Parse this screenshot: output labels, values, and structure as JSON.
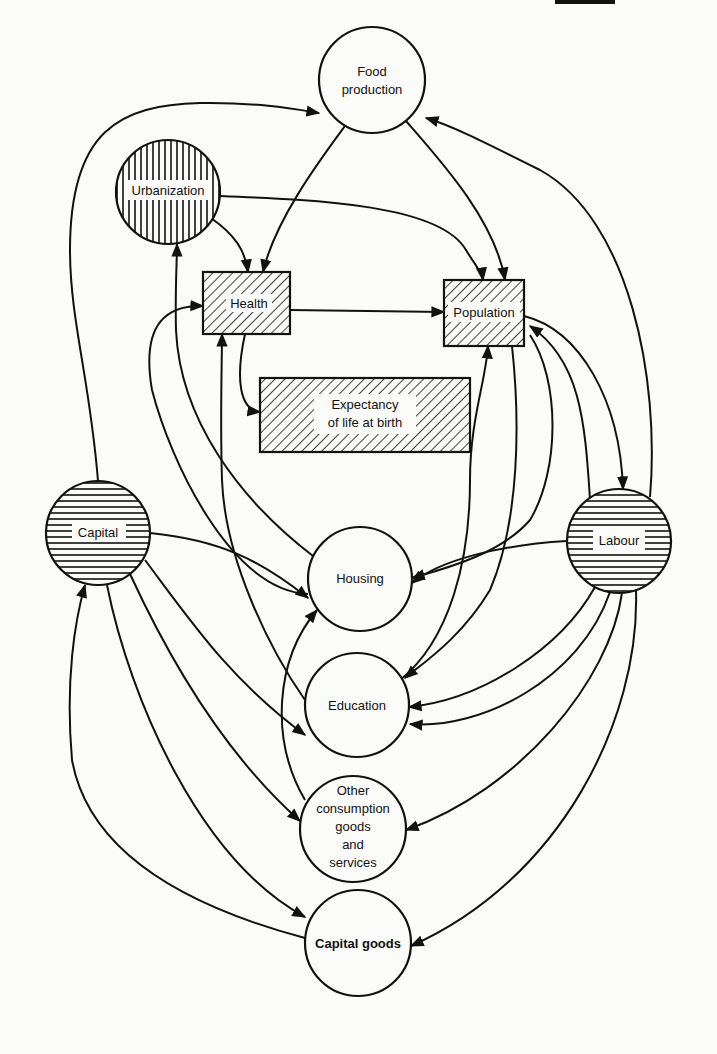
{
  "figure": {
    "title": "",
    "nodes": [
      {
        "id": "food_production",
        "lines": [
          "Food",
          "production"
        ],
        "shape": "circle",
        "fill": "plain"
      },
      {
        "id": "urbanization",
        "lines": [
          "Urbanization"
        ],
        "shape": "circle",
        "fill": "vertical-hatch"
      },
      {
        "id": "health",
        "lines": [
          "Health"
        ],
        "shape": "rect",
        "fill": "diagonal-hatch"
      },
      {
        "id": "population",
        "lines": [
          "Population"
        ],
        "shape": "rect",
        "fill": "diagonal-hatch"
      },
      {
        "id": "life_expectancy",
        "lines": [
          "Expectancy",
          "of life at birth"
        ],
        "shape": "rect",
        "fill": "diagonal-hatch"
      },
      {
        "id": "capital",
        "lines": [
          "Capital"
        ],
        "shape": "circle",
        "fill": "horizontal-hatch"
      },
      {
        "id": "labour",
        "lines": [
          "Labour"
        ],
        "shape": "circle",
        "fill": "horizontal-hatch"
      },
      {
        "id": "housing",
        "lines": [
          "Housing"
        ],
        "shape": "circle",
        "fill": "plain"
      },
      {
        "id": "education",
        "lines": [
          "Education"
        ],
        "shape": "circle",
        "fill": "plain"
      },
      {
        "id": "other_consumption",
        "lines": [
          "Other",
          "consumption",
          "goods",
          "and",
          "services"
        ],
        "shape": "circle",
        "fill": "plain"
      },
      {
        "id": "capital_goods",
        "lines": [
          "Capital goods"
        ],
        "shape": "circle",
        "fill": "plain"
      }
    ],
    "edges": [
      {
        "from": "capital",
        "to": "food_production"
      },
      {
        "from": "labour",
        "to": "food_production"
      },
      {
        "from": "food_production",
        "to": "health"
      },
      {
        "from": "food_production",
        "to": "population"
      },
      {
        "from": "urbanization",
        "to": "health"
      },
      {
        "from": "urbanization",
        "to": "population"
      },
      {
        "from": "health",
        "to": "population"
      },
      {
        "from": "health",
        "to": "life_expectancy"
      },
      {
        "from": "housing",
        "to": "urbanization"
      },
      {
        "from": "housing",
        "to": "health"
      },
      {
        "from": "education",
        "to": "health"
      },
      {
        "from": "other_consumption",
        "to": "health"
      },
      {
        "from": "housing",
        "to": "population"
      },
      {
        "from": "education",
        "to": "population"
      },
      {
        "from": "population",
        "to": "labour"
      },
      {
        "from": "population",
        "to": "education"
      },
      {
        "from": "population",
        "to": "housing"
      },
      {
        "from": "capital",
        "to": "housing"
      },
      {
        "from": "capital",
        "to": "education"
      },
      {
        "from": "capital",
        "to": "other_consumption"
      },
      {
        "from": "capital",
        "to": "capital_goods"
      },
      {
        "from": "capital_goods",
        "to": "capital"
      },
      {
        "from": "labour",
        "to": "housing"
      },
      {
        "from": "labour",
        "to": "education"
      },
      {
        "from": "labour",
        "to": "other_consumption"
      },
      {
        "from": "labour",
        "to": "capital_goods"
      },
      {
        "from": "other_consumption",
        "to": "housing"
      }
    ],
    "legend": {
      "vertical_hatch": "Urbanization",
      "horizontal_hatch": "Capital, Labour",
      "diagonal_hatch": "Health, Population, Expectancy of life at birth"
    }
  },
  "labels": {
    "food_1": "Food",
    "food_2": "production",
    "urbanization": "Urbanization",
    "health": "Health",
    "population": "Population",
    "expect_1": "Expectancy",
    "expect_2": "of life at birth",
    "capital": "Capital",
    "labour": "Labour",
    "housing": "Housing",
    "education": "Education",
    "other_1": "Other",
    "other_2": "consumption",
    "other_3": "goods",
    "other_4": "and",
    "other_5": "services",
    "capital_goods": "Capital goods"
  },
  "colors": {
    "ink": "#111111",
    "paper": "#fbfbf9"
  }
}
